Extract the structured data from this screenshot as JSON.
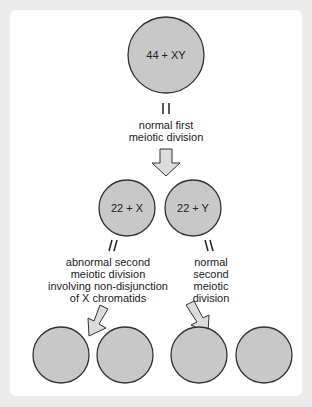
{
  "diagram": {
    "title": "",
    "colors": {
      "background": "#ececec",
      "panel": "#ffffff",
      "cell_fill": "#c8c8c8",
      "cell_stroke": "#333333",
      "arrow_fill": "#dcdcdc"
    },
    "cells": {
      "parent": "44 + XY",
      "secondary_x": "22 + X",
      "secondary_y": "22 + Y",
      "gametes": [
        "",
        "",
        "",
        ""
      ]
    },
    "labels": {
      "first_division": [
        "normal first",
        "meiotic division"
      ],
      "abnormal_second": [
        "abnormal second",
        "meiotic division",
        "involving non-disjunction",
        "of X chromatids"
      ],
      "normal_second": [
        "normal",
        "second",
        "meiotic",
        "division"
      ]
    }
  }
}
